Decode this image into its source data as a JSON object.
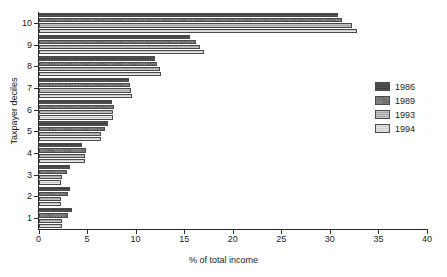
{
  "chart_data": {
    "type": "bar",
    "orientation": "horizontal",
    "title": "",
    "xlabel": "% of total income",
    "ylabel": "Taxpayer deciles",
    "categories": [
      "1",
      "2",
      "3",
      "4",
      "5",
      "6",
      "7",
      "8",
      "9",
      "10"
    ],
    "xlim": [
      0,
      40
    ],
    "xticks": [
      0,
      5,
      10,
      15,
      20,
      25,
      30,
      35,
      40
    ],
    "grid": false,
    "legend_position": "right",
    "series": [
      {
        "name": "1986",
        "color": "#3f3f3f",
        "values": [
          3.4,
          3.2,
          3.2,
          4.5,
          7.2,
          7.6,
          9.3,
          12.0,
          15.6,
          30.8
        ]
      },
      {
        "name": "1989",
        "color": "#6d6d6d",
        "values": [
          3.0,
          3.0,
          2.9,
          4.9,
          6.8,
          7.8,
          9.4,
          12.2,
          16.2,
          31.2
        ]
      },
      {
        "name": "1993",
        "color": "#a8a8a8",
        "values": [
          2.4,
          2.3,
          2.4,
          4.8,
          6.4,
          7.7,
          9.5,
          12.5,
          16.6,
          32.3
        ]
      },
      {
        "name": "1994",
        "color": "#cfcfcf",
        "values": [
          2.4,
          2.3,
          2.3,
          4.8,
          6.4,
          7.7,
          9.6,
          12.6,
          17.0,
          32.8
        ]
      }
    ]
  }
}
